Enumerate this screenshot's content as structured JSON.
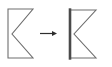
{
  "canvas": {
    "width": 112,
    "height": 67,
    "background": "#ffffff",
    "title": "shape edge transformation"
  },
  "palette": {
    "outline": "#6e6e6e",
    "outline_dark": "#3c3c3c",
    "highlight": "#4a4a4a",
    "arrow": "#2e2e2e",
    "background": "#ffffff"
  },
  "diagram": {
    "type": "before-after",
    "label": "shape-transformation",
    "arrow": {
      "name": "right-arrow",
      "direction": "right",
      "label": "",
      "x1": 40,
      "y1": 33.5,
      "x2": 57,
      "y2": 33.5,
      "stroke_width": 1.2,
      "head_length": 5,
      "head_width": 5
    },
    "shapes": [
      {
        "name": "source-shape",
        "label": "before",
        "kind": "chevron-notch-polygon",
        "points": "8,9 33,9 12,34 33,58 8,58",
        "stroke": "#6e6e6e",
        "stroke_width": 1.1,
        "fill": "none",
        "highlighted_edge": null,
        "highlight_stroke_width": 0
      },
      {
        "name": "result-shape",
        "label": "after",
        "kind": "chevron-notch-polygon",
        "points": "70,10 96,10 74,34 96,58 70,58",
        "stroke": "#6e6e6e",
        "stroke_width": 1.1,
        "fill": "none",
        "highlighted_edge": "70,10 70,58",
        "highlight_stroke_width": 2.6
      }
    ]
  }
}
